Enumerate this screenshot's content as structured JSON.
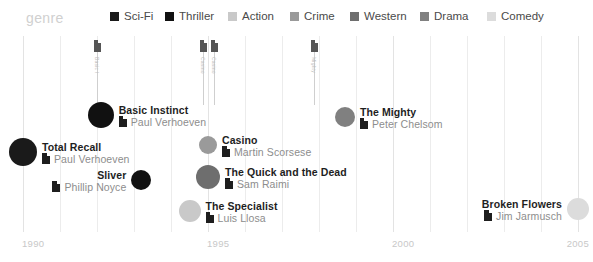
{
  "legend": {
    "title": "genre",
    "items": [
      {
        "label": "Sci-Fi",
        "color": "#1a1a1a"
      },
      {
        "label": "Thriller",
        "color": "#111111"
      },
      {
        "label": "Action",
        "color": "#c9c9c9"
      },
      {
        "label": "Crime",
        "color": "#9a9a9a"
      },
      {
        "label": "Western",
        "color": "#6e6e6e"
      },
      {
        "label": "Drama",
        "color": "#808080"
      },
      {
        "label": "Comedy",
        "color": "#dcdcdc"
      }
    ]
  },
  "axis": {
    "label": "",
    "ticks": [
      "1990",
      "1995",
      "2000",
      "2005"
    ],
    "tick_values": [
      1990,
      1995,
      2000,
      2005
    ],
    "range": [
      1989.4,
      2005.6
    ]
  },
  "stems": [
    {
      "text": "Basic I",
      "icon": "film-icon"
    },
    {
      "text": "Casino",
      "icon": "film-icon"
    },
    {
      "text": "Casino",
      "icon": "film-icon"
    },
    {
      "text": "Mighty",
      "icon": "film-icon"
    }
  ],
  "chart_data": {
    "type": "scatter",
    "title": "genre",
    "xlabel": "",
    "ylabel": "",
    "xlim": [
      1989.4,
      2005.6
    ],
    "xticks": [
      1990,
      1995,
      2000,
      2005
    ],
    "grid": true,
    "legend_position": "top",
    "series": [
      {
        "name": "Sci-Fi",
        "color": "#1a1a1a",
        "points": [
          {
            "title": "Total Recall",
            "director": "Paul Verhoeven",
            "x": 1990.0,
            "y": 152,
            "size": 14,
            "label_side": "right"
          }
        ]
      },
      {
        "name": "Thriller",
        "color": "#111111",
        "points": [
          {
            "title": "Basic Instinct",
            "director": "Paul Verhoeven",
            "x": 1992.1,
            "y": 115,
            "size": 13,
            "label_side": "right"
          },
          {
            "title": "Sliver",
            "director": "Phillip Noyce",
            "x": 1993.2,
            "y": 180,
            "size": 10,
            "label_side": "left"
          }
        ]
      },
      {
        "name": "Crime",
        "color": "#9a9a9a",
        "points": [
          {
            "title": "Casino",
            "director": "Martin Scorsese",
            "x": 1995.0,
            "y": 145,
            "size": 9,
            "label_side": "right"
          }
        ]
      },
      {
        "name": "Western",
        "color": "#6e6e6e",
        "points": [
          {
            "title": "The Quick and the Dead",
            "director": "Sam Raimi",
            "x": 1995.0,
            "y": 177,
            "size": 12,
            "label_side": "right"
          }
        ]
      },
      {
        "name": "Action",
        "color": "#c9c9c9",
        "points": [
          {
            "title": "The Specialist",
            "director": "Luis Llosa",
            "x": 1994.5,
            "y": 211,
            "size": 11,
            "label_side": "right"
          }
        ]
      },
      {
        "name": "Drama",
        "color": "#808080",
        "points": [
          {
            "title": "The Mighty",
            "director": "Peter Chelsom",
            "x": 1998.7,
            "y": 117,
            "size": 10,
            "label_side": "right"
          }
        ]
      },
      {
        "name": "Comedy",
        "color": "#dcdcdc",
        "points": [
          {
            "title": "Broken Flowers",
            "director": "Jim Jarmusch",
            "x": 2005.0,
            "y": 209,
            "size": 11,
            "label_side": "left"
          }
        ]
      }
    ]
  }
}
